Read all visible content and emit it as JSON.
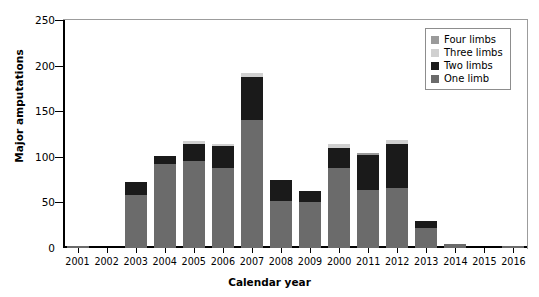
{
  "chart_data": {
    "type": "bar",
    "title": "",
    "xlabel": "Calendar year",
    "ylabel": "Major amputations",
    "ylim": [
      0,
      250
    ],
    "yticks": [
      0,
      50,
      100,
      150,
      200,
      250
    ],
    "grid": false,
    "stacked": true,
    "legend_position": "top-right",
    "categories": [
      "2001",
      "2002",
      "2003",
      "2004",
      "2005",
      "2006",
      "2007",
      "2008",
      "2009",
      "2000",
      "2011",
      "2012",
      "2013",
      "2014",
      "2015",
      "2016"
    ],
    "series": [
      {
        "name": "One limb",
        "color": "#6b6b6b",
        "values": [
          2,
          0,
          58,
          92,
          95,
          88,
          140,
          52,
          50,
          88,
          64,
          66,
          22,
          4,
          0,
          2
        ]
      },
      {
        "name": "Two limbs",
        "color": "#1a1a1a",
        "values": [
          0,
          0,
          14,
          9,
          19,
          24,
          48,
          23,
          12,
          22,
          38,
          48,
          8,
          0,
          0,
          0
        ]
      },
      {
        "name": "Three limbs",
        "color": "#d0d0d0",
        "values": [
          0,
          0,
          0,
          0,
          3,
          2,
          4,
          0,
          0,
          4,
          0,
          4,
          0,
          0,
          0,
          0
        ]
      },
      {
        "name": "Four limbs",
        "color": "#9a9a9a",
        "values": [
          0,
          0,
          0,
          0,
          0,
          0,
          0,
          0,
          0,
          0,
          2,
          0,
          0,
          0,
          0,
          0
        ]
      }
    ],
    "totals": [
      2,
      0,
      72,
      101,
      117,
      114,
      192,
      75,
      62,
      114,
      104,
      118,
      30,
      4,
      0,
      2
    ]
  },
  "legend": {
    "items": [
      {
        "label": "Four limbs",
        "color": "#9a9a9a"
      },
      {
        "label": "Three limbs",
        "color": "#d0d0d0"
      },
      {
        "label": "Two limbs",
        "color": "#1a1a1a"
      },
      {
        "label": "One limb",
        "color": "#6b6b6b"
      }
    ]
  }
}
